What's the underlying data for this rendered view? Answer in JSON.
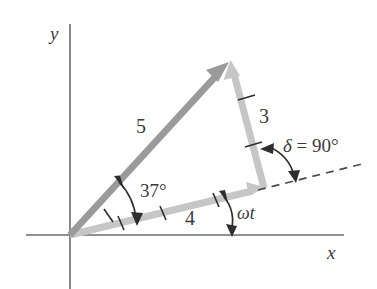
{
  "figure": {
    "kind": "vector-phasor-diagram",
    "background_color": "#ffffff",
    "axes": {
      "x_label": "x",
      "y_label": "y",
      "axis_color": "#6b6b6b",
      "origin_px": [
        70,
        235
      ]
    },
    "vectors": [
      {
        "name": "resultant-vector-5",
        "label": "5",
        "magnitude": 5,
        "color": "#9a9a9a",
        "tick_marks": 1,
        "from_px": [
          70,
          235
        ],
        "to_px": [
          228,
          63
        ],
        "label_px": [
          136,
          116
        ]
      },
      {
        "name": "component-vector-4",
        "label": "4",
        "magnitude": 4,
        "color": "#c6c6c6",
        "tick_marks": 3,
        "from_px": [
          70,
          235
        ],
        "to_px": [
          264,
          188
        ],
        "label_px": [
          185,
          208
        ]
      },
      {
        "name": "component-vector-3",
        "label": "3",
        "magnitude": 3,
        "color": "#c6c6c6",
        "tick_marks": 2,
        "from_px": [
          264,
          188
        ],
        "to_px": [
          231,
          61
        ],
        "label_px": [
          259,
          106
        ]
      }
    ],
    "angles": [
      {
        "name": "angle-37",
        "label": "37°",
        "value_deg": 37,
        "label_px": [
          140,
          181
        ],
        "arc_color": "#2d2d2d"
      },
      {
        "name": "angle-omega-t",
        "label": "ωt",
        "label_px": [
          237,
          204
        ],
        "arc_color": "#2d2d2d"
      },
      {
        "name": "angle-delta",
        "label_symbol": "δ",
        "label_rest": " = 90°",
        "value_deg": 90,
        "label_px": [
          283,
          136
        ],
        "arc_color": "#2d2d2d"
      }
    ],
    "dashed_reference_line": {
      "name": "phase-reference-dashed-line",
      "from_px": [
        264,
        188
      ],
      "to_px": [
        362,
        164
      ],
      "color": "#4a4a4a",
      "dash": "7 6"
    }
  }
}
